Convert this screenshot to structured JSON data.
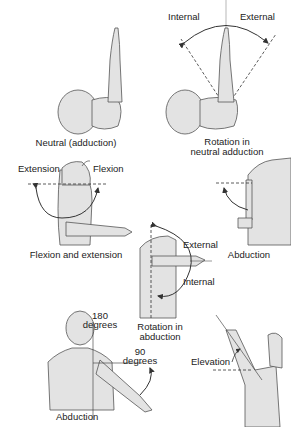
{
  "figure": {
    "colors": {
      "fill": "#e3e3e3",
      "stroke": "#555555",
      "text": "#222222",
      "background": "#ffffff"
    }
  },
  "panels": [
    {
      "id": "neutral",
      "caption": "Neutral (adduction)",
      "labels": []
    },
    {
      "id": "rotation-neutral",
      "caption": "Rotation in neutral adduction",
      "caption_lines": [
        "Rotation in",
        "neutral adduction"
      ],
      "labels": [
        "Internal",
        "External"
      ]
    },
    {
      "id": "flexion-extension",
      "caption": "Flexion and extension",
      "labels": [
        "Extension",
        "Flexion"
      ]
    },
    {
      "id": "abduction-side",
      "caption": "Abduction",
      "labels": []
    },
    {
      "id": "rotation-abduction",
      "caption": "Rotation in abduction",
      "caption_lines": [
        "Rotation in",
        "abduction"
      ],
      "labels": [
        "External",
        "Internal"
      ]
    },
    {
      "id": "abduction-back",
      "caption": "Abduction",
      "labels": [
        "180",
        "degrees",
        "90",
        "degrees"
      ]
    },
    {
      "id": "elevation",
      "caption": "",
      "labels": [
        "Elevation"
      ]
    }
  ]
}
